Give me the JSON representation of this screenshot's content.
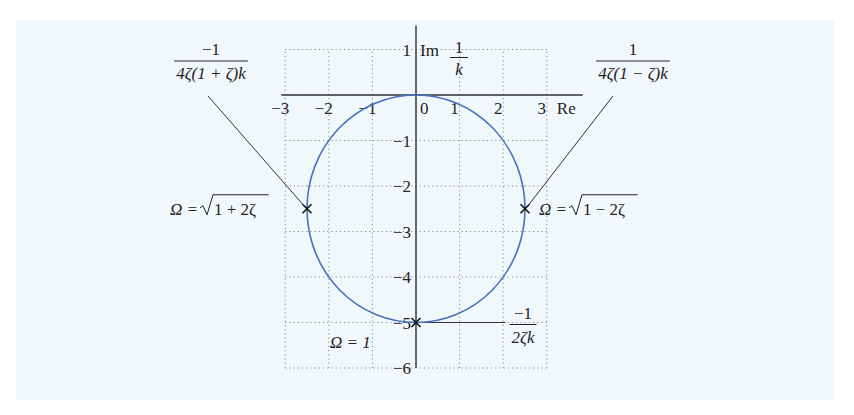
{
  "chart_data": {
    "type": "line",
    "title": "",
    "xlabel": "Re",
    "ylabel": "Im 1/k",
    "ylabel_parts": {
      "prefix": "Im",
      "num": "1",
      "den": "k"
    },
    "xlim": [
      -3,
      3
    ],
    "ylim": [
      -6,
      1
    ],
    "grid": true,
    "x_ticks": [
      -3,
      -2,
      -1,
      0,
      1,
      2,
      3
    ],
    "x_tick_labels": [
      "−3",
      "−2",
      "−1",
      "0",
      "1",
      "2",
      "3"
    ],
    "y_ticks": [
      1,
      -1,
      -2,
      -3,
      -4,
      -5,
      -6
    ],
    "y_tick_labels": [
      "1",
      "−1",
      "−2",
      "−3",
      "−4",
      "−5",
      "−6"
    ],
    "series": [
      {
        "name": "locus",
        "shape": "circle",
        "center": [
          0,
          -2.5
        ],
        "radius": 2.5,
        "color": "#4a72c0"
      }
    ],
    "points": [
      {
        "name": "omega-sqrt-1-plus-2zeta",
        "x": -2.5,
        "y": -2.5,
        "label": "Ω = √1 + 2ζ",
        "label_sqrt_body": "1 + 2ζ",
        "label_prefix": "Ω = "
      },
      {
        "name": "omega-sqrt-1-minus-2zeta",
        "x": 2.5,
        "y": -2.5,
        "label": "Ω = √1 − 2ζ",
        "label_sqrt_body": "1 − 2ζ",
        "label_prefix": "Ω = "
      },
      {
        "name": "omega-1",
        "x": 0,
        "y": -5,
        "label": "Ω = 1"
      }
    ],
    "annotations": [
      {
        "name": "left-fraction",
        "num": "−1",
        "den": "4ζ(1 + ζ)k",
        "points_to": [
          -2.5,
          -2.5
        ]
      },
      {
        "name": "right-fraction",
        "num": "1",
        "den": "4ζ(1 − ζ)k",
        "points_to": [
          2.5,
          -2.5
        ]
      },
      {
        "name": "bottom-fraction",
        "num": "−1",
        "den": "2ζk",
        "points_to": [
          0,
          -5
        ]
      }
    ],
    "colors": {
      "curve": "#4a72c0",
      "axis": "#333333",
      "grid": "#8a8a8a",
      "background": "#f1f8fc"
    }
  }
}
